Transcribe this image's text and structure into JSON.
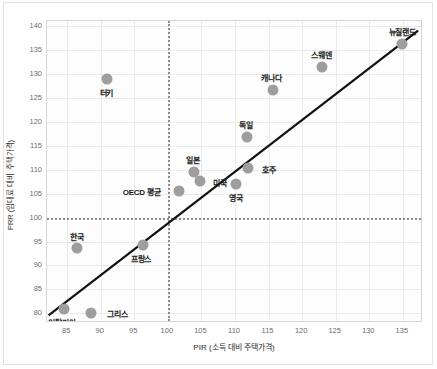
{
  "chart_data": {
    "type": "scatter",
    "title": "",
    "xlabel": "PIR (소득 대비 주택가격)",
    "ylabel": "PRR (임대료 대비 주택가격)",
    "xlim": [
      82,
      138
    ],
    "ylim": [
      78,
      141
    ],
    "xticks": [
      85,
      90,
      95,
      100,
      105,
      110,
      115,
      120,
      125,
      130,
      135
    ],
    "yticks": [
      80,
      85,
      90,
      95,
      100,
      105,
      110,
      115,
      120,
      125,
      130,
      135,
      140
    ],
    "grid": true,
    "legend": "none",
    "marker_color": "#9e9e9e",
    "trendline_color": "#111111",
    "reference_lines": {
      "vertical_x": 100,
      "horizontal_y": 100,
      "style": "dotted",
      "color": "#8e8e8e"
    },
    "trendline": {
      "x_start": 82.2,
      "y_start": 79.2,
      "x_end": 137.6,
      "y_end": 139.0
    },
    "points": [
      {
        "name": "이탈리아",
        "x": 84.5,
        "y": 81.0,
        "label_dx": -2,
        "label_dy": 13
      },
      {
        "name": "그리스",
        "x": 88.6,
        "y": 80.1,
        "label_dx": 26,
        "label_dy": 0
      },
      {
        "name": "한국",
        "x": 86.4,
        "y": 93.7,
        "label_dx": 0,
        "label_dy": -12
      },
      {
        "name": "프랑스",
        "x": 96.3,
        "y": 94.2,
        "label_dx": -2,
        "label_dy": 13
      },
      {
        "name": "터키",
        "x": 91.0,
        "y": 128.8,
        "label_dx": -1,
        "label_dy": 13
      },
      {
        "name": "OECD 평균",
        "x": 101.6,
        "y": 105.5,
        "label_dx": -37,
        "label_dy": 0
      },
      {
        "name": "일본",
        "x": 103.9,
        "y": 109.6,
        "label_dx": -1,
        "label_dy": -13
      },
      {
        "name": "미국",
        "x": 104.8,
        "y": 107.6,
        "label_dx": 20,
        "label_dy": 1
      },
      {
        "name": "영국",
        "x": 110.1,
        "y": 107.1,
        "label_dx": 0,
        "label_dy": 13
      },
      {
        "name": "호주",
        "x": 111.9,
        "y": 110.3,
        "label_dx": 21,
        "label_dy": 1
      },
      {
        "name": "독일",
        "x": 111.8,
        "y": 116.9,
        "label_dx": -1,
        "label_dy": -13
      },
      {
        "name": "캐나다",
        "x": 115.6,
        "y": 126.7,
        "label_dx": -1,
        "label_dy": -13
      },
      {
        "name": "스웨덴",
        "x": 123.0,
        "y": 131.3,
        "label_dx": -1,
        "label_dy": -13
      },
      {
        "name": "뉴질랜드",
        "x": 134.9,
        "y": 136.2,
        "label_dx": 0,
        "label_dy": -13
      }
    ]
  }
}
